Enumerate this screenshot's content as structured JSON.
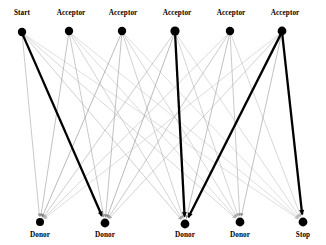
{
  "figure": {
    "kind": "bipartite-transition-diagram",
    "width": 326,
    "height": 245,
    "background": "#ffffff",
    "edge_color_light": "#b8b8b8",
    "edge_color_mid": "#6e6e6e",
    "edge_color_dark": "#000000",
    "node_color": "#000000"
  },
  "top_nodes": [
    {
      "id": "t0",
      "label": "Start",
      "x": 22,
      "y": 32,
      "r": 4.2,
      "label_x": 22,
      "label_y": 10
    },
    {
      "id": "t1",
      "label": "Acceptor",
      "x": 69,
      "y": 31,
      "r": 4.2,
      "label_x": 71,
      "label_y": 10
    },
    {
      "id": "t2",
      "label": "Acceptor",
      "x": 122,
      "y": 31,
      "r": 4.2,
      "label_x": 123,
      "label_y": 10
    },
    {
      "id": "t3",
      "label": "Acceptor",
      "x": 175,
      "y": 31,
      "r": 4.6,
      "label_x": 177,
      "label_y": 10
    },
    {
      "id": "t4",
      "label": "Acceptor",
      "x": 230,
      "y": 31,
      "r": 4.2,
      "label_x": 231,
      "label_y": 10
    },
    {
      "id": "t5",
      "label": "Acceptor",
      "x": 282,
      "y": 31,
      "r": 4.4,
      "label_x": 285,
      "label_y": 10
    }
  ],
  "bottom_nodes": [
    {
      "id": "b0",
      "label": "Donor",
      "x": 40,
      "y": 222,
      "r": 4.0,
      "label_x": 40,
      "label_y": 232
    },
    {
      "id": "b1",
      "label": "Donor",
      "x": 105,
      "y": 223,
      "r": 4.4,
      "label_x": 105,
      "label_y": 232
    },
    {
      "id": "b2",
      "label": "Donor",
      "x": 185,
      "y": 224,
      "r": 4.4,
      "label_x": 185,
      "label_y": 232
    },
    {
      "id": "b3",
      "label": "Donor",
      "x": 240,
      "y": 222,
      "r": 4.4,
      "label_x": 240,
      "label_y": 232
    },
    {
      "id": "b4",
      "label": "Stop",
      "x": 303,
      "y": 222,
      "r": 4.4,
      "label_x": 303,
      "label_y": 232
    }
  ],
  "edges": [
    {
      "from": "t0",
      "to": "b0",
      "weight": 0.18
    },
    {
      "from": "t0",
      "to": "b1",
      "weight": 1.0
    },
    {
      "from": "t0",
      "to": "b2",
      "weight": 0.16
    },
    {
      "from": "t0",
      "to": "b3",
      "weight": 0.14
    },
    {
      "from": "t0",
      "to": "b4",
      "weight": 0.12
    },
    {
      "from": "t1",
      "to": "b0",
      "weight": 0.2
    },
    {
      "from": "t1",
      "to": "b1",
      "weight": 0.18
    },
    {
      "from": "t1",
      "to": "b2",
      "weight": 0.15
    },
    {
      "from": "t1",
      "to": "b3",
      "weight": 0.13
    },
    {
      "from": "t1",
      "to": "b4",
      "weight": 0.12
    },
    {
      "from": "t2",
      "to": "b0",
      "weight": 0.22
    },
    {
      "from": "t2",
      "to": "b1",
      "weight": 0.2
    },
    {
      "from": "t2",
      "to": "b2",
      "weight": 0.16
    },
    {
      "from": "t2",
      "to": "b3",
      "weight": 0.14
    },
    {
      "from": "t2",
      "to": "b4",
      "weight": 0.12
    },
    {
      "from": "t3",
      "to": "b0",
      "weight": 0.17
    },
    {
      "from": "t3",
      "to": "b1",
      "weight": 0.22
    },
    {
      "from": "t3",
      "to": "b2",
      "weight": 1.0
    },
    {
      "from": "t3",
      "to": "b3",
      "weight": 0.15
    },
    {
      "from": "t3",
      "to": "b4",
      "weight": 0.13
    },
    {
      "from": "t4",
      "to": "b0",
      "weight": 0.14
    },
    {
      "from": "t4",
      "to": "b1",
      "weight": 0.18
    },
    {
      "from": "t4",
      "to": "b2",
      "weight": 0.2
    },
    {
      "from": "t4",
      "to": "b3",
      "weight": 0.18
    },
    {
      "from": "t4",
      "to": "b4",
      "weight": 0.14
    },
    {
      "from": "t5",
      "to": "b0",
      "weight": 0.13
    },
    {
      "from": "t5",
      "to": "b1",
      "weight": 0.15
    },
    {
      "from": "t5",
      "to": "b2",
      "weight": 1.0
    },
    {
      "from": "t5",
      "to": "b3",
      "weight": 0.2
    },
    {
      "from": "t5",
      "to": "b4",
      "weight": 1.0
    }
  ]
}
